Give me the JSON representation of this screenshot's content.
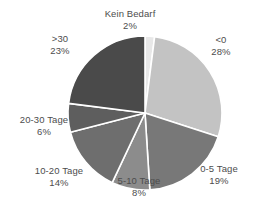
{
  "chart_data": {
    "type": "pie",
    "title": "",
    "subtitle": "",
    "xlabel": "",
    "ylabel": "",
    "legend_position": "none",
    "grid": false,
    "labels_show_percent": true,
    "start_angle_deg": 0,
    "direction": "clockwise",
    "categories": [
      "Kein Bedarf",
      "<0",
      "0-5 Tage",
      "5-10 Tage",
      "10-20 Tage",
      "20-30 Tage",
      ">30"
    ],
    "values": [
      2,
      28,
      19,
      8,
      14,
      6,
      23
    ],
    "value_unit": "%",
    "slices": [
      {
        "label": "Kein Bedarf",
        "value": 2,
        "value_text": "2%",
        "color": "#e8e8e8"
      },
      {
        "label": "<0",
        "value": 28,
        "value_text": "28%",
        "color": "#c3c3c3"
      },
      {
        "label": "0-5 Tage",
        "value": 19,
        "value_text": "19%",
        "color": "#787878"
      },
      {
        "label": "5-10 Tage",
        "value": 8,
        "value_text": "8%",
        "color": "#8c8c8c"
      },
      {
        "label": "10-20 Tage",
        "value": 14,
        "value_text": "14%",
        "color": "#6e6e6e"
      },
      {
        "label": "20-30 Tage",
        "value": 6,
        "value_text": "6%",
        "color": "#5e5e5e"
      },
      {
        "label": ">30",
        "value": 23,
        "value_text": "23%",
        "color": "#4a4a4a"
      }
    ],
    "geometry": {
      "center_x": 145,
      "center_y": 113,
      "radius": 77
    },
    "style": {
      "divider_color": "#ffffff",
      "divider_width": 1.6,
      "label_color": "#4d4d4d",
      "background": "#ffffff"
    }
  }
}
